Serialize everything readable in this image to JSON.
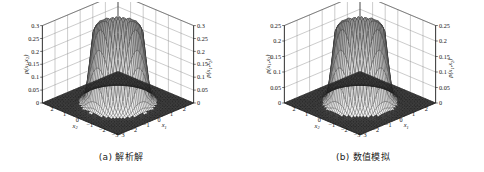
{
  "figure": {
    "panels": [
      {
        "id": "a",
        "caption": "(a) 解析解",
        "zlabel_left": "p(x1,x2)",
        "zlabel_right": "p(x1,x2)",
        "xlabel_left": "x2",
        "xlabel_right": "x1",
        "z_ticks": [
          "0.3",
          "0.25",
          "0.2",
          "0.15",
          "0.1",
          "0.05",
          "0"
        ],
        "x_ticks_left": [
          "2",
          "1",
          "0",
          "-1",
          "-2",
          "-3"
        ],
        "x_ticks_right": [
          "2",
          "1",
          "0",
          "-1",
          "-2",
          "-3"
        ]
      },
      {
        "id": "b",
        "caption": "(b) 数值模拟",
        "zlabel_left": "p(x1,x2)",
        "zlabel_right": "p(x1,x2)",
        "xlabel_left": "x2",
        "xlabel_right": "x1",
        "z_ticks": [
          "0.25",
          "0.2",
          "0.15",
          "0.1",
          "0.05",
          "0"
        ],
        "x_ticks_left": [
          "2",
          "1",
          "0",
          "-1",
          "-2",
          "-3"
        ],
        "x_ticks_right": [
          "2",
          "1",
          "0",
          "-1",
          "-2",
          "-3"
        ]
      }
    ]
  },
  "chart_data": [
    {
      "type": "surface",
      "title": "(a) 解析解",
      "xlabel": "x1",
      "ylabel": "x2",
      "zlabel": "p(x1,x2)",
      "xlim": [
        -3,
        3
      ],
      "ylim": [
        -3,
        3
      ],
      "zlim": [
        0,
        0.3
      ],
      "z_ticks": [
        0,
        0.05,
        0.1,
        0.15,
        0.2,
        0.25,
        0.3
      ],
      "x_ticks": [
        -3,
        -2,
        -1,
        0,
        1,
        2
      ],
      "y_ticks": [
        -3,
        -2,
        -1,
        0,
        1,
        2
      ],
      "grid": true,
      "legend": "none",
      "description": "Mesh surface of a radially symmetric flat-topped (mesa / crater-rim) probability density. Value is near zero for radius > ~1.8, rises steeply to a plateau of about 0.26 with a slightly raised rim reaching ~0.30 near radius ~1.2.",
      "radial_profile": {
        "r": [
          0.0,
          0.2,
          0.4,
          0.6,
          0.8,
          1.0,
          1.2,
          1.4,
          1.6,
          1.8,
          2.0,
          2.2,
          2.4,
          2.6,
          3.0
        ],
        "p": [
          0.255,
          0.256,
          0.258,
          0.262,
          0.27,
          0.285,
          0.3,
          0.275,
          0.15,
          0.045,
          0.012,
          0.004,
          0.001,
          0.0,
          0.0
        ]
      }
    },
    {
      "type": "surface",
      "title": "(b) 数值模拟",
      "xlabel": "x1",
      "ylabel": "x2",
      "zlabel": "p(x1,x2)",
      "xlim": [
        -3,
        3
      ],
      "ylim": [
        -3,
        3
      ],
      "zlim": [
        0,
        0.25
      ],
      "z_ticks": [
        0,
        0.05,
        0.1,
        0.15,
        0.2,
        0.25
      ],
      "x_ticks": [
        -3,
        -2,
        -1,
        0,
        1,
        2
      ],
      "y_ticks": [
        -3,
        -2,
        -1,
        0,
        1,
        2
      ],
      "grid": true,
      "legend": "none",
      "description": "Numerically simulated counterpart of panel (a): same radially symmetric mesa shape with a slightly lower and noisier plateau near 0.22 and rim peak about 0.25.",
      "radial_profile": {
        "r": [
          0.0,
          0.2,
          0.4,
          0.6,
          0.8,
          1.0,
          1.2,
          1.4,
          1.6,
          1.8,
          2.0,
          2.2,
          2.4,
          2.6,
          3.0
        ],
        "p": [
          0.215,
          0.216,
          0.218,
          0.222,
          0.228,
          0.238,
          0.25,
          0.23,
          0.125,
          0.038,
          0.01,
          0.003,
          0.001,
          0.0,
          0.0
        ]
      }
    }
  ]
}
